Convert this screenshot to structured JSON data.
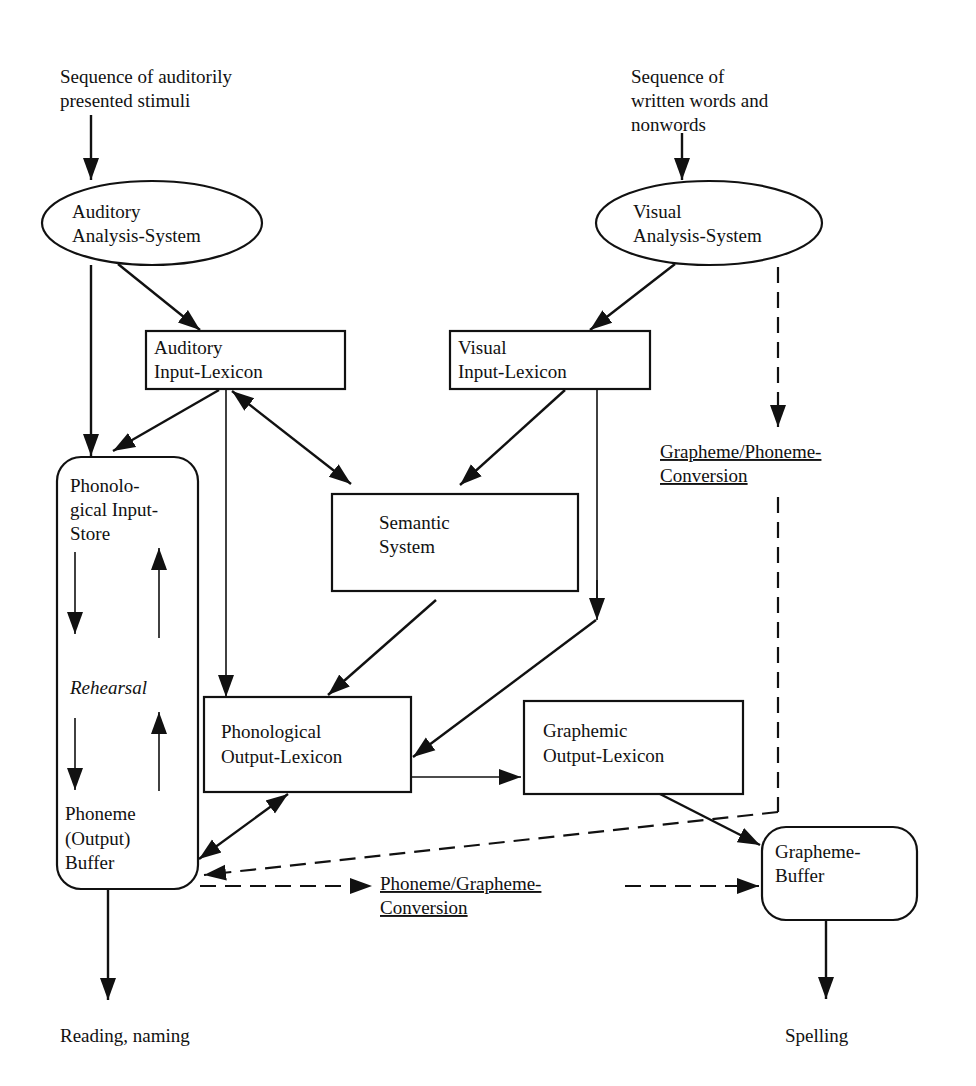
{
  "diagram": {
    "title": "",
    "inputs": {
      "auditory": [
        "Sequence of auditorily",
        "presented stimuli"
      ],
      "visual": [
        "Sequence of",
        "written words and",
        "nonwords"
      ]
    },
    "nodes": {
      "auditory_analysis": {
        "shape": "ellipse",
        "lines": [
          "Auditory",
          "Analysis-System"
        ]
      },
      "visual_analysis": {
        "shape": "ellipse",
        "lines": [
          "Visual",
          "Analysis-System"
        ]
      },
      "auditory_input_lexicon": {
        "shape": "rect",
        "lines": [
          "Auditory",
          "Input-Lexicon"
        ]
      },
      "visual_input_lexicon": {
        "shape": "rect",
        "lines": [
          "Visual",
          "Input-Lexicon"
        ]
      },
      "semantic_system": {
        "shape": "rect",
        "lines": [
          "Semantic",
          "System"
        ]
      },
      "phonological_store": {
        "shape": "rounded-rect",
        "top_lines": [
          "Phonolo-",
          "gical Input-",
          "Store"
        ],
        "middle": "Rehearsal",
        "bottom_lines": [
          "Phoneme",
          "(Output)",
          "Buffer"
        ]
      },
      "phonological_output_lexicon": {
        "shape": "rect",
        "lines": [
          "Phonological",
          "Output-Lexicon"
        ]
      },
      "graphemic_output_lexicon": {
        "shape": "rect",
        "lines": [
          "Graphemic",
          "Output-Lexicon"
        ]
      },
      "grapheme_buffer": {
        "shape": "rounded-rect",
        "lines": [
          "Grapheme-",
          "Buffer"
        ]
      }
    },
    "conversion_routes": {
      "grapheme_phoneme": [
        "Grapheme/Phoneme-",
        "Conversion"
      ],
      "phoneme_grapheme": [
        "Phoneme/Grapheme-",
        "Conversion"
      ]
    },
    "outputs": {
      "reading": "Reading, naming",
      "spelling": "Spelling"
    },
    "edges": [
      {
        "from": "auditory_input",
        "to": "auditory_analysis",
        "style": "solid"
      },
      {
        "from": "visual_input",
        "to": "visual_analysis",
        "style": "solid"
      },
      {
        "from": "auditory_analysis",
        "to": "auditory_input_lexicon",
        "style": "solid"
      },
      {
        "from": "auditory_analysis",
        "to": "phonological_store",
        "style": "solid"
      },
      {
        "from": "visual_analysis",
        "to": "visual_input_lexicon",
        "style": "solid"
      },
      {
        "from": "visual_analysis",
        "to": "grapheme_phoneme_conversion",
        "style": "dashed"
      },
      {
        "from": "auditory_input_lexicon",
        "to": "phonological_store",
        "style": "solid"
      },
      {
        "from": "auditory_input_lexicon",
        "to": "semantic_system",
        "style": "solid",
        "bidirectional": true
      },
      {
        "from": "auditory_input_lexicon",
        "to": "phonological_output_lexicon",
        "style": "solid"
      },
      {
        "from": "visual_input_lexicon",
        "to": "semantic_system",
        "style": "solid"
      },
      {
        "from": "visual_input_lexicon",
        "to": "phonological_output_lexicon",
        "style": "solid"
      },
      {
        "from": "semantic_system",
        "to": "phonological_output_lexicon",
        "style": "solid"
      },
      {
        "from": "phonological_output_lexicon",
        "to": "graphemic_output_lexicon",
        "style": "solid"
      },
      {
        "from": "phonological_output_lexicon",
        "to": "phonological_store",
        "style": "solid",
        "bidirectional": true
      },
      {
        "from": "grapheme_phoneme_conversion",
        "to": "phonological_store",
        "style": "dashed"
      },
      {
        "from": "phonological_store",
        "to": "phoneme_grapheme_conversion",
        "style": "dashed"
      },
      {
        "from": "phoneme_grapheme_conversion",
        "to": "grapheme_buffer",
        "style": "dashed"
      },
      {
        "from": "graphemic_output_lexicon",
        "to": "grapheme_buffer",
        "style": "solid"
      },
      {
        "from": "phonological_store",
        "to": "reading_output",
        "style": "solid"
      },
      {
        "from": "grapheme_buffer",
        "to": "spelling_output",
        "style": "solid"
      }
    ]
  }
}
